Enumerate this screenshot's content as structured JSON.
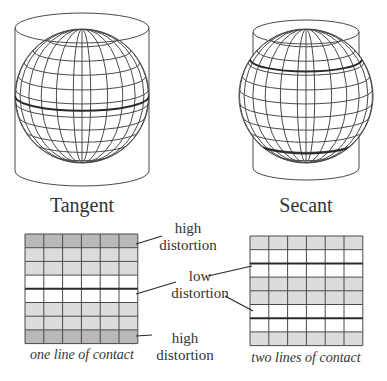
{
  "diagram": {
    "colors": {
      "line": "#4a4a4a",
      "contact_line": "#2a2a2a",
      "high_distortion": "#b9b9b9",
      "medium_distortion": "#dcdcdc",
      "low_distortion": "#ffffff",
      "text": "#333333"
    },
    "panels": [
      {
        "id": "tangent",
        "title": "Tangent",
        "caption": "one line of contact",
        "globe": {
          "cx": 82,
          "cy": 96,
          "r": 67
        },
        "cylinder": {
          "cx": 82,
          "rx": 67,
          "ry": 15,
          "top": 28,
          "bottom": 171
        },
        "contact_latitudes": [
          0
        ],
        "grid": {
          "x": 25,
          "y": 234,
          "cols": 6,
          "rows": 8,
          "cell_w": 18.8,
          "cell_h": 13.7,
          "row_shading": [
            "high",
            "medium",
            "medium",
            "low",
            "low",
            "medium",
            "medium",
            "high"
          ],
          "thick_lines_after_rows": [
            4
          ]
        }
      },
      {
        "id": "secant",
        "title": "Secant",
        "caption": "two lines of contact",
        "globe": {
          "cx": 306,
          "cy": 96,
          "r": 67
        },
        "cylinder": {
          "cx": 306,
          "rx": 53,
          "ry": 12,
          "top": 32,
          "bottom": 168
        },
        "contact_latitudes": [
          -0.55,
          0.7
        ],
        "grid": {
          "x": 250,
          "y": 236,
          "cols": 6,
          "rows": 8,
          "cell_w": 18.8,
          "cell_h": 13.7,
          "row_shading": [
            "medium",
            "low",
            "low",
            "medium",
            "medium",
            "low",
            "low",
            "medium"
          ],
          "thick_lines_after_rows": [
            2,
            6
          ]
        }
      }
    ],
    "annotations": [
      {
        "id": "high-top",
        "text_line1": "high",
        "text_line2": "distortion",
        "x": 150,
        "y": 222,
        "pointer": [
          [
            162,
            236
          ],
          [
            136,
            244
          ]
        ]
      },
      {
        "id": "low",
        "text_line1": "low",
        "text_line2": "distortion",
        "x": 162,
        "y": 270,
        "pointer_left": [
          [
            176,
            282
          ],
          [
            136,
            294
          ]
        ],
        "pointer_right_1": [
          [
            208,
            276
          ],
          [
            252,
            266
          ]
        ],
        "pointer_right_2": [
          [
            225,
            296
          ],
          [
            253,
            311
          ]
        ]
      },
      {
        "id": "high-bottom",
        "text_line1": "high",
        "text_line2": "distortion",
        "x": 147,
        "y": 327,
        "pointer": [
          [
            152,
            335
          ],
          [
            136,
            336
          ]
        ]
      }
    ]
  }
}
